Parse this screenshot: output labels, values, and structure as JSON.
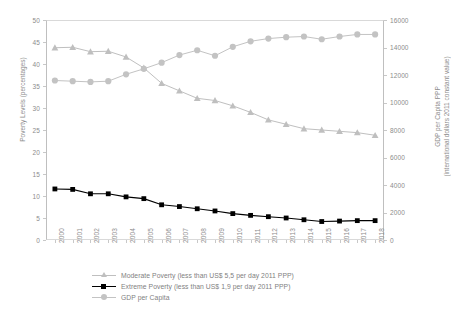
{
  "chart_data": {
    "type": "line",
    "title": "",
    "xlabel": "",
    "categories": [
      "2000",
      "2001",
      "2002",
      "2003",
      "2004",
      "2005",
      "2006",
      "2007",
      "2008",
      "2009",
      "2010",
      "2011",
      "2012",
      "2013",
      "2014",
      "2015",
      "2016",
      "2017",
      "2018"
    ],
    "grid": false,
    "legend_position": "bottom",
    "axes": {
      "left": {
        "label": "Poverty Levels (percentages)",
        "min": 0,
        "max": 50,
        "step": 5,
        "ticks": [
          "0",
          "5",
          "10",
          "15",
          "20",
          "25",
          "30",
          "35",
          "40",
          "45",
          "50"
        ]
      },
      "right": {
        "label_line1": "GDP per Capita PPP",
        "label_line2": "(international dollars 2011 constant value)",
        "min": 0,
        "max": 16000,
        "step": 2000,
        "ticks": [
          "0",
          "2000",
          "4000",
          "6000",
          "8000",
          "10000",
          "12000",
          "14000",
          "16000"
        ]
      }
    },
    "series": [
      {
        "name": "Moderate Poverty (less than US$ 5,5 per day 2011 PPP)",
        "axis": "left",
        "color": "#bfbfbf",
        "marker": "triangle",
        "values": [
          43.7,
          43.8,
          42.8,
          42.9,
          41.6,
          39.1,
          35.6,
          33.9,
          32.2,
          31.7,
          30.5,
          29.0,
          27.3,
          26.3,
          25.3,
          25.0,
          24.7,
          24.4,
          23.8
        ]
      },
      {
        "name": "Extreme Poverty (less than US$ 1,9 per day 2011 PPP)",
        "axis": "left",
        "color": "#000000",
        "marker": "square",
        "values": [
          11.6,
          11.5,
          10.5,
          10.5,
          9.8,
          9.4,
          8.0,
          7.6,
          7.1,
          6.6,
          6.0,
          5.6,
          5.3,
          5.0,
          4.6,
          4.2,
          4.3,
          4.4,
          4.4
        ]
      },
      {
        "name": "GDP per Capita",
        "axis": "right",
        "color": "#c3c3c3",
        "marker": "circle",
        "values": [
          11600,
          11550,
          11500,
          11550,
          12050,
          12450,
          12900,
          13450,
          13800,
          13400,
          14050,
          14450,
          14650,
          14750,
          14800,
          14600,
          14800,
          14950,
          14950
        ]
      }
    ]
  },
  "legend": {
    "items": [
      {
        "label": "Moderate Poverty (less than US$ 5,5 per day 2011 PPP)"
      },
      {
        "label": "Extreme Poverty (less than US$ 1,9 per day 2011 PPP)"
      },
      {
        "label": "GDP per Capita"
      }
    ]
  }
}
